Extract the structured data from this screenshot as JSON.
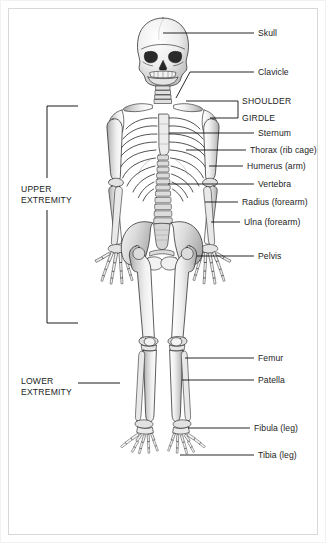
{
  "figure": {
    "view": "anterior",
    "background_color": "#ffffff",
    "border_color": "#d8d8d8",
    "label_color": "#1c1c1c",
    "leader_line_color": "#000000",
    "bone_fill_color": "#e8e8e8",
    "bone_outline_color": "#1a1a1a"
  },
  "labels_right": [
    {
      "id": "skull",
      "text": "Skull"
    },
    {
      "id": "clavicle",
      "text": "Clavicle"
    },
    {
      "id": "shoulder-girdle-line1",
      "text": "SHOULDER"
    },
    {
      "id": "shoulder-girdle-line2",
      "text": "GIRDLE"
    },
    {
      "id": "sternum",
      "text": "Sternum"
    },
    {
      "id": "thorax",
      "text": "Thorax (rib cage)"
    },
    {
      "id": "humerus",
      "text": "Humerus (arm)"
    },
    {
      "id": "vertebra",
      "text": "Vertebra"
    },
    {
      "id": "radius",
      "text": "Radius (forearm)"
    },
    {
      "id": "ulna",
      "text": "Ulna (forearm)"
    },
    {
      "id": "pelvis",
      "text": "Pelvis"
    },
    {
      "id": "femur",
      "text": "Femur"
    },
    {
      "id": "patella",
      "text": "Patella"
    },
    {
      "id": "fibula",
      "text": "Fibula (leg)"
    },
    {
      "id": "tibia",
      "text": "Tibia (leg)"
    }
  ],
  "labels_left": [
    {
      "id": "upper-extremity-line1",
      "text": "UPPER"
    },
    {
      "id": "upper-extremity-line2",
      "text": "EXTREMITY"
    },
    {
      "id": "lower-extremity-line1",
      "text": "LOWER"
    },
    {
      "id": "lower-extremity-line2",
      "text": "EXTREMITY"
    }
  ]
}
